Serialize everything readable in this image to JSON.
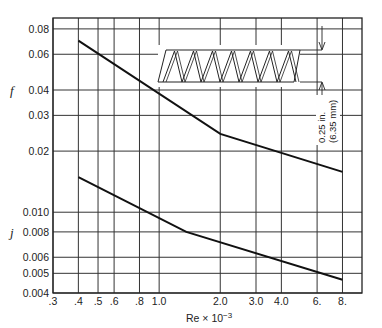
{
  "chart_data": {
    "type": "line",
    "title": "",
    "xlabel": "Re × 10⁻³",
    "ylabel_upper": "f",
    "ylabel_lower": "j",
    "xscale": "log",
    "yscale": "log",
    "xlim": [
      0.3,
      10
    ],
    "ylim": [
      0.004,
      0.09
    ],
    "grid": true,
    "x_ticks": [
      {
        "value": 0.3,
        "label": ".3"
      },
      {
        "value": 0.4,
        "label": ".4"
      },
      {
        "value": 0.5,
        "label": ".5"
      },
      {
        "value": 0.6,
        "label": ".6"
      },
      {
        "value": 0.8,
        "label": ".8"
      },
      {
        "value": 1.0,
        "label": "1.0"
      },
      {
        "value": 2.0,
        "label": "2.0"
      },
      {
        "value": 3.0,
        "label": "3.0"
      },
      {
        "value": 4.0,
        "label": "4.0"
      },
      {
        "value": 6.0,
        "label": "6."
      },
      {
        "value": 8.0,
        "label": "8."
      }
    ],
    "y_ticks": [
      {
        "value": 0.08,
        "label": "0.08"
      },
      {
        "value": 0.06,
        "label": "0.06"
      },
      {
        "value": 0.04,
        "label": "0.04"
      },
      {
        "value": 0.03,
        "label": "0.03"
      },
      {
        "value": 0.02,
        "label": "0.02"
      },
      {
        "value": 0.01,
        "label": "0.010"
      },
      {
        "value": 0.008,
        "label": "0.008"
      },
      {
        "value": 0.006,
        "label": "0.006"
      },
      {
        "value": 0.005,
        "label": "0.005"
      },
      {
        "value": 0.004,
        "label": "0.004"
      }
    ],
    "series": [
      {
        "name": "f",
        "x": [
          0.4,
          2.0,
          8.0
        ],
        "y": [
          0.07,
          0.0243,
          0.0158
        ]
      },
      {
        "name": "j",
        "x": [
          0.4,
          1.36,
          8.0
        ],
        "y": [
          0.0149,
          0.008,
          0.00465
        ]
      }
    ],
    "annotations": [
      {
        "type": "inset-drawing",
        "description": "plain triangular fin cross-section"
      },
      {
        "type": "dimension",
        "text_line1": "0.25 in.",
        "text_line2": "(6.35 mm)"
      }
    ]
  },
  "labels": {
    "f": "f",
    "j": "j",
    "xlabel_base": "Re × 10",
    "xlabel_exp": "−3",
    "dim_in": "0.25 in.",
    "dim_mm": "(6.35 mm)"
  }
}
